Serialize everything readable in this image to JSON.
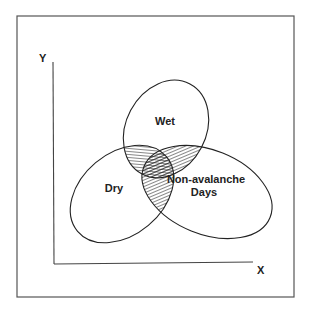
{
  "diagram": {
    "type": "venn",
    "axes": {
      "x_label": "X",
      "y_label": "Y"
    },
    "sets": [
      {
        "id": "wet",
        "label": "Wet"
      },
      {
        "id": "dry",
        "label": "Dry"
      },
      {
        "id": "non_avalanche",
        "label_line1": "Non-avalanche",
        "label_line2": "Days"
      }
    ],
    "overlaps": [
      {
        "sets": [
          "wet",
          "dry"
        ],
        "hatched": true
      },
      {
        "sets": [
          "wet",
          "non_avalanche"
        ],
        "hatched": true
      },
      {
        "sets": [
          "dry",
          "non_avalanche"
        ],
        "hatched": true
      }
    ],
    "colors": {
      "stroke": "#222222",
      "frame": "#555555",
      "background": "#ffffff"
    }
  }
}
